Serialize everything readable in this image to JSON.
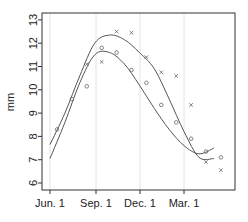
{
  "chart_data": {
    "type": "scatter",
    "title": "",
    "xlabel": "",
    "ylabel": "mm",
    "ylim": [
      5.9,
      13.2
    ],
    "yticks": [
      6,
      7,
      8,
      9,
      10,
      11,
      12,
      13
    ],
    "xticks": [
      "Jun. 1",
      "Sep. 1",
      "Dec. 1",
      "Mar. 1"
    ],
    "grid": "vertical lines at x ticks",
    "legend": "none",
    "x": [
      "Jun",
      "Jul",
      "Aug",
      "Sep",
      "Oct",
      "Nov",
      "Dec",
      "Jan",
      "Feb",
      "Mar",
      "Apr",
      "May"
    ],
    "series": [
      {
        "name": "circles",
        "marker": "o",
        "values": [
          8.3,
          9.6,
          10.15,
          11.8,
          11.6,
          10.85,
          10.3,
          9.35,
          8.6,
          7.9,
          7.35,
          7.1
        ],
        "smooth_curve": [
          7.05,
          8.6,
          10.3,
          11.5,
          11.6,
          11.1,
          10.2,
          9.2,
          8.3,
          7.6,
          7.25,
          7.5
        ]
      },
      {
        "name": "crosses",
        "marker": "x",
        "values": [
          null,
          null,
          11.1,
          11.2,
          12.5,
          12.45,
          11.4,
          10.75,
          10.6,
          9.35,
          6.9,
          6.55
        ],
        "smooth_curve": [
          7.65,
          9.0,
          10.6,
          12.0,
          12.35,
          12.15,
          11.6,
          10.9,
          9.6,
          8.2,
          7.1,
          7.05
        ]
      }
    ]
  },
  "axes": {
    "ylabel": "mm",
    "yticks": [
      "6",
      "7",
      "8",
      "9",
      "10",
      "11",
      "12",
      "13"
    ],
    "xticks": [
      "Jun. 1",
      "Sep. 1",
      "Dec. 1",
      "Mar. 1"
    ]
  }
}
